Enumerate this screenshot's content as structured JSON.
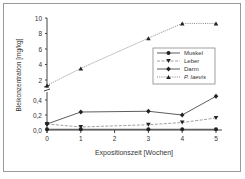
{
  "chart_data": {
    "type": "line",
    "title": "",
    "xlabel": "Expositionszeit [Wochen]",
    "ylabel": "Bleikonzentration [mg/kg]",
    "x": [
      0,
      1,
      3,
      4,
      5
    ],
    "xticks": [
      "0",
      "1",
      "2",
      "3",
      "4",
      "5"
    ],
    "yticks_lower": [
      "0,0",
      "0,2",
      "0,4"
    ],
    "yticks_upper": [
      "2",
      "4",
      "6",
      "8",
      "10"
    ],
    "axis_break": true,
    "ylim_lower": [
      0,
      0.5
    ],
    "ylim_upper": [
      1,
      10
    ],
    "legend_position": "upper right inside",
    "grid": false,
    "series": [
      {
        "name": "Muskel",
        "marker": "circle",
        "line": "solid",
        "values": [
          0.01,
          0.01,
          0.01,
          0.01,
          0.01
        ]
      },
      {
        "name": "Leber",
        "marker": "triangle-down",
        "line": "dashed",
        "values": [
          0.08,
          0.04,
          0.07,
          0.1,
          0.16
        ]
      },
      {
        "name": "Darm",
        "marker": "diamond",
        "line": "solid",
        "values": [
          0.08,
          0.24,
          0.25,
          0.2,
          0.45
        ]
      },
      {
        "name": "P. laevis",
        "marker": "triangle-up",
        "line": "dotted",
        "values": [
          1.3,
          3.5,
          7.4,
          9.3,
          9.3
        ]
      }
    ]
  }
}
